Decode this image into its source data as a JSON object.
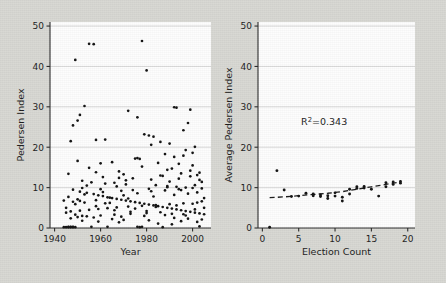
{
  "figure": {
    "background_color": "#d7d7d2",
    "panel_color": "#fdfdfd",
    "point_color": "#111111",
    "grid_color": "#c8c8c8",
    "axis_color": "#2b2b2b"
  },
  "chart_data": [
    {
      "type": "scatter",
      "panel": "left",
      "title": "",
      "xlabel": "Year",
      "ylabel": "Pedersen Index",
      "xlim": [
        1938,
        2008
      ],
      "ylim": [
        0,
        51
      ],
      "xticks": [
        1940,
        1960,
        1980,
        2000
      ],
      "yticks": [
        0,
        10,
        20,
        30,
        40,
        50
      ],
      "grid": true,
      "legend": "none",
      "points": [
        [
          1945,
          0.2
        ],
        [
          1946,
          0.2
        ],
        [
          1946,
          0.3
        ],
        [
          1947,
          0.2
        ],
        [
          1947,
          0.3
        ],
        [
          1948,
          0.2
        ],
        [
          1948,
          0.3
        ],
        [
          1949,
          0.2
        ],
        [
          1946,
          13.4
        ],
        [
          1947,
          21.5
        ],
        [
          1948,
          25.4
        ],
        [
          1949,
          41.6
        ],
        [
          1950,
          26.6
        ],
        [
          1951,
          28.0
        ],
        [
          1952,
          3.0
        ],
        [
          1953,
          30.2
        ],
        [
          1955,
          45.6
        ],
        [
          1957,
          45.5
        ],
        [
          1958,
          21.8
        ],
        [
          1960,
          16.0
        ],
        [
          1962,
          21.9
        ],
        [
          1972,
          29.0
        ],
        [
          1976,
          27.4
        ],
        [
          1978,
          46.3
        ],
        [
          1980,
          39.0
        ],
        [
          1979,
          23.2
        ],
        [
          1981,
          22.9
        ],
        [
          1983,
          22.6
        ],
        [
          1982,
          20.6
        ],
        [
          1986,
          21.3
        ],
        [
          1990,
          20.9
        ],
        [
          1992,
          29.9
        ],
        [
          1993,
          29.8
        ],
        [
          1999,
          29.3
        ],
        [
          1998,
          26.0
        ],
        [
          1996,
          24.2
        ],
        [
          2001,
          20.1
        ],
        [
          1997,
          19.3
        ],
        [
          1988,
          18.3
        ],
        [
          1975,
          17.2
        ],
        [
          1976,
          17.3
        ],
        [
          1977,
          17.1
        ],
        [
          1950,
          16.6
        ],
        [
          1965,
          16.3
        ],
        [
          1985,
          16.1
        ],
        [
          1994,
          15.9
        ],
        [
          2000,
          15.5
        ],
        [
          1970,
          13.3
        ],
        [
          1991,
          14.7
        ],
        [
          1999,
          14.2
        ],
        [
          2002,
          13.1
        ],
        [
          1995,
          13.5
        ],
        [
          1987,
          12.9
        ],
        [
          1968,
          12.4
        ],
        [
          1974,
          12.3
        ],
        [
          2003,
          11.9
        ],
        [
          1952,
          11.7
        ],
        [
          1956,
          11.3
        ],
        [
          1962,
          11.0
        ],
        [
          1966,
          11.2
        ],
        [
          1971,
          10.8
        ],
        [
          1984,
          10.6
        ],
        [
          1989,
          10.4
        ],
        [
          1993,
          10.2
        ],
        [
          1997,
          10.0
        ],
        [
          2001,
          10.6
        ],
        [
          2004,
          9.8
        ],
        [
          1948,
          9.5
        ],
        [
          1951,
          9.0
        ],
        [
          1954,
          8.7
        ],
        [
          1957,
          8.4
        ],
        [
          1959,
          8.1
        ],
        [
          1961,
          7.9
        ],
        [
          1963,
          7.6
        ],
        [
          1965,
          7.4
        ],
        [
          1967,
          7.2
        ],
        [
          1969,
          7.0
        ],
        [
          1971,
          6.8
        ],
        [
          1973,
          6.6
        ],
        [
          1975,
          6.4
        ],
        [
          1977,
          6.2
        ],
        [
          1979,
          6.0
        ],
        [
          1981,
          5.8
        ],
        [
          1983,
          5.6
        ],
        [
          1985,
          5.4
        ],
        [
          1987,
          5.2
        ],
        [
          1989,
          5.0
        ],
        [
          1991,
          4.8
        ],
        [
          1993,
          4.6
        ],
        [
          1995,
          4.4
        ],
        [
          1997,
          4.2
        ],
        [
          1999,
          4.0
        ],
        [
          2001,
          3.8
        ],
        [
          2003,
          3.6
        ],
        [
          2005,
          3.4
        ],
        [
          1949,
          5.9
        ],
        [
          1953,
          6.3
        ],
        [
          1958,
          6.9
        ],
        [
          1964,
          7.5
        ],
        [
          1970,
          8.1
        ],
        [
          1976,
          8.6
        ],
        [
          1982,
          9.1
        ],
        [
          1988,
          9.3
        ],
        [
          1994,
          9.6
        ],
        [
          2000,
          9.9
        ],
        [
          1947,
          4.1
        ],
        [
          1951,
          4.3
        ],
        [
          1955,
          4.5
        ],
        [
          1959,
          4.7
        ],
        [
          1963,
          4.9
        ],
        [
          1967,
          5.1
        ],
        [
          1972,
          5.3
        ],
        [
          1978,
          5.5
        ],
        [
          1984,
          5.7
        ],
        [
          1990,
          5.9
        ],
        [
          1996,
          6.1
        ],
        [
          2002,
          6.3
        ],
        [
          1950,
          2.7
        ],
        [
          1954,
          2.9
        ],
        [
          1960,
          3.1
        ],
        [
          1966,
          3.3
        ],
        [
          1973,
          3.5
        ],
        [
          1980,
          3.7
        ],
        [
          1986,
          3.9
        ],
        [
          1992,
          2.5
        ],
        [
          1998,
          2.3
        ],
        [
          2004,
          2.1
        ],
        [
          1952,
          1.8
        ],
        [
          1959,
          1.6
        ],
        [
          1968,
          1.4
        ],
        [
          1976,
          0.3
        ],
        [
          1977,
          0.2
        ],
        [
          1978,
          0.3
        ],
        [
          1985,
          1.1
        ],
        [
          1991,
          0.9
        ],
        [
          2003,
          0.4
        ],
        [
          1956,
          0.3
        ],
        [
          1963,
          0.3
        ],
        [
          1987,
          0.2
        ],
        [
          1946,
          7.7
        ],
        [
          1953,
          8.3
        ],
        [
          1961,
          8.9
        ],
        [
          1969,
          9.2
        ],
        [
          1974,
          9.4
        ],
        [
          1981,
          9.7
        ],
        [
          1989,
          10.1
        ],
        [
          1995,
          9.4
        ],
        [
          2002,
          8.8
        ],
        [
          2005,
          7.4
        ],
        [
          1964,
          6.2
        ],
        [
          1958,
          5.4
        ],
        [
          1951,
          6.7
        ],
        [
          1972,
          7.3
        ],
        [
          1983,
          7.8
        ],
        [
          1992,
          8.2
        ],
        [
          1998,
          8.5
        ],
        [
          2004,
          6.6
        ],
        [
          1966,
          4.4
        ],
        [
          1975,
          4.8
        ],
        [
          1984,
          5.2
        ],
        [
          1993,
          5.6
        ],
        [
          2000,
          6.0
        ],
        [
          1947,
          2.4
        ],
        [
          1957,
          2.6
        ],
        [
          1969,
          2.8
        ],
        [
          1979,
          3.0
        ],
        [
          1988,
          3.2
        ],
        [
          1996,
          3.4
        ],
        [
          2001,
          4.6
        ],
        [
          1990,
          11.5
        ],
        [
          1982,
          12.0
        ],
        [
          1971,
          11.8
        ],
        [
          1961,
          12.6
        ],
        [
          1955,
          14.9
        ],
        [
          1994,
          12.2
        ],
        [
          2003,
          13.7
        ],
        [
          1999,
          12.8
        ],
        [
          1986,
          13.0
        ],
        [
          1967,
          10.3
        ],
        [
          1952,
          9.9
        ],
        [
          1948,
          6.5
        ],
        [
          1962,
          6.1
        ],
        [
          1973,
          4.0
        ],
        [
          1980,
          4.2
        ],
        [
          1991,
          3.5
        ],
        [
          1997,
          3.1
        ],
        [
          2005,
          5.0
        ],
        [
          1949,
          3.3
        ],
        [
          1965,
          2.2
        ],
        [
          1970,
          2.0
        ],
        [
          1981,
          1.9
        ],
        [
          1995,
          1.7
        ],
        [
          2002,
          1.5
        ],
        [
          1960,
          9.6
        ],
        [
          1954,
          10.5
        ],
        [
          1944,
          0.2
        ],
        [
          1992,
          17.6
        ],
        [
          1996,
          17.9
        ],
        [
          2000,
          18.6
        ],
        [
          2004,
          11.4
        ],
        [
          1989,
          14.4
        ],
        [
          1978,
          15.2
        ],
        [
          1968,
          14.0
        ],
        [
          1958,
          13.8
        ],
        [
          1950,
          7.1
        ],
        [
          1944,
          6.8
        ],
        [
          1945,
          5.0
        ],
        [
          1945,
          3.8
        ]
      ]
    },
    {
      "type": "scatter",
      "panel": "right",
      "title": "",
      "xlabel": "Election Count",
      "ylabel": "Average Pedersen Index",
      "xlim": [
        -0.6,
        21
      ],
      "ylim": [
        0,
        51
      ],
      "xticks": [
        0,
        5,
        10,
        15,
        20
      ],
      "yticks": [
        0,
        10,
        20,
        30,
        40,
        50
      ],
      "grid": true,
      "legend": "none",
      "annotation": {
        "text": "R²=0.343",
        "x": 8.5,
        "y": 25.5
      },
      "points": [
        [
          1,
          0.2
        ],
        [
          2,
          14.2
        ],
        [
          3,
          9.4
        ],
        [
          4,
          7.8
        ],
        [
          5,
          7.9
        ],
        [
          6,
          8.6
        ],
        [
          7,
          8.4
        ],
        [
          7,
          8.0
        ],
        [
          8,
          8.2
        ],
        [
          8,
          7.8
        ],
        [
          9,
          7.3
        ],
        [
          9,
          8.0
        ],
        [
          10,
          7.9
        ],
        [
          10,
          8.7
        ],
        [
          11,
          6.7
        ],
        [
          11,
          7.6
        ],
        [
          12,
          9.6
        ],
        [
          12,
          8.4
        ],
        [
          13,
          10.2
        ],
        [
          13,
          9.8
        ],
        [
          14,
          10.3
        ],
        [
          14,
          9.9
        ],
        [
          15,
          9.6
        ],
        [
          16,
          7.9
        ],
        [
          17,
          11.2
        ],
        [
          17,
          10.2
        ],
        [
          18,
          11.4
        ],
        [
          18,
          10.8
        ],
        [
          19,
          11.5
        ],
        [
          19,
          11.1
        ]
      ],
      "fit_line": {
        "style": "dashed",
        "x": [
          1,
          3,
          5,
          7,
          9,
          11,
          13,
          15,
          17,
          19
        ],
        "y": [
          7.5,
          7.7,
          8.0,
          8.3,
          8.6,
          9.0,
          9.6,
          10.2,
          10.8,
          11.4
        ]
      }
    }
  ]
}
